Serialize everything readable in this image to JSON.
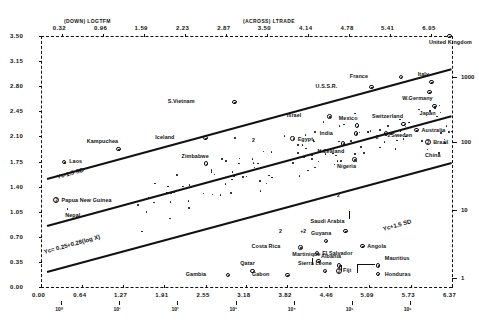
{
  "chart_data": {
    "type": "scatter",
    "title": "",
    "xlabel": "(ACROSS) LTRADE",
    "ylabel": "(DOWN) LOGTFM",
    "xlim": [
      0.0,
      6.37
    ],
    "ylim": [
      0.0,
      3.5
    ],
    "grid": false,
    "legend": "none",
    "x_ticks": [
      "0.00",
      "0.64",
      "1.27",
      "1.91",
      "2.55",
      "3.18",
      "3.82",
      "4.46",
      "5.09",
      "5.73",
      "6.37"
    ],
    "y_ticks": [
      "3.50",
      "3.15",
      "2.80",
      "2.45",
      "2.10",
      "1.75",
      "1.40",
      "1.05",
      "0.70",
      "0.35",
      "0.00"
    ],
    "top_ticks": [
      "0.32",
      "0.96",
      "1.59",
      "2.23",
      "2.87",
      "3.50",
      "4.14",
      "4.78",
      "5.41",
      "6.05"
    ],
    "right_axis_labels": [
      "1000",
      "100",
      "10",
      "1"
    ],
    "x_power_labels": [
      "10⁰",
      "10¹",
      "10²",
      "10³",
      "10⁴",
      "10⁵",
      "10⁶"
    ],
    "annotations": [
      {
        "text": "Yc= 0.25+0.28(log X)",
        "role": "fitted-regression-line"
      },
      {
        "text": "Yc-1.5 SD",
        "role": "lower-confidence-band"
      },
      {
        "text": "Yc+1.5 SD",
        "role": "upper-confidence-band"
      }
    ],
    "labeled_points": [
      {
        "label": "United Kingdom",
        "x": 6.33,
        "y": 3.5,
        "marker": "circle"
      },
      {
        "label": "France",
        "x": 5.58,
        "y": 2.93,
        "marker": "circle"
      },
      {
        "label": "Italy",
        "x": 6.05,
        "y": 2.86,
        "marker": "circle"
      },
      {
        "label": "U.S.S.R.",
        "x": 5.12,
        "y": 2.79,
        "marker": "circle"
      },
      {
        "label": "W.Germany",
        "x": 6.02,
        "y": 2.72,
        "marker": "circle"
      },
      {
        "label": "Japan",
        "x": 6.1,
        "y": 2.52,
        "marker": "circle"
      },
      {
        "label": "S.Vietnam",
        "x": 3.0,
        "y": 2.58,
        "marker": "circle"
      },
      {
        "label": "Israel",
        "x": 4.47,
        "y": 2.38,
        "marker": "circle"
      },
      {
        "label": "Mexico",
        "x": 4.9,
        "y": 2.25,
        "marker": "circle"
      },
      {
        "label": "Switzerland",
        "x": 5.62,
        "y": 2.27,
        "marker": "circle"
      },
      {
        "label": "Australia",
        "x": 5.82,
        "y": 2.19,
        "marker": "circle"
      },
      {
        "label": "India",
        "x": 4.88,
        "y": 2.14,
        "marker": "circle"
      },
      {
        "label": "Sweden",
        "x": 5.35,
        "y": 2.14,
        "marker": "circle"
      },
      {
        "label": "Iceland",
        "x": 2.55,
        "y": 2.08,
        "marker": "circle"
      },
      {
        "label": "Egypt",
        "x": 3.9,
        "y": 2.07,
        "marker": "circle"
      },
      {
        "label": "N.Zealand",
        "x": 4.68,
        "y": 2.0,
        "marker": "circle"
      },
      {
        "label": "Brazil",
        "x": 6.0,
        "y": 2.02,
        "marker": "circle-2"
      },
      {
        "label": "China",
        "x": 5.98,
        "y": 1.93,
        "marker": "dot"
      },
      {
        "label": "Kampuchea",
        "x": 1.2,
        "y": 1.92,
        "marker": "circle"
      },
      {
        "label": "Nigeria",
        "x": 4.86,
        "y": 1.78,
        "marker": "circle"
      },
      {
        "label": "Laos",
        "x": 0.36,
        "y": 1.74,
        "marker": "circle"
      },
      {
        "label": "Zimbabwe",
        "x": 2.56,
        "y": 1.72,
        "marker": "circle"
      },
      {
        "label": "Papua New Guinea",
        "x": 0.24,
        "y": 1.22,
        "marker": "circle-2"
      },
      {
        "label": "Nepal",
        "x": 0.4,
        "y": 1.1,
        "marker": "dot"
      },
      {
        "label": "Saudi Arabia",
        "x": 4.72,
        "y": 0.78,
        "marker": "circle"
      },
      {
        "label": "Guyana",
        "x": 4.42,
        "y": 0.64,
        "marker": "circle"
      },
      {
        "label": "Angola",
        "x": 4.98,
        "y": 0.57,
        "marker": "circle"
      },
      {
        "label": "Costa Rica",
        "x": 4.02,
        "y": 0.55,
        "marker": "circle"
      },
      {
        "label": "El Salvador",
        "x": 4.28,
        "y": 0.47,
        "marker": "circle"
      },
      {
        "label": "Martinique",
        "x": 4.3,
        "y": 0.36,
        "marker": "circle"
      },
      {
        "label": "Albania",
        "x": 4.62,
        "y": 0.3,
        "marker": "circle"
      },
      {
        "label": "Qatar",
        "x": 3.28,
        "y": 0.22,
        "marker": "circle"
      },
      {
        "label": "Sierra Leone",
        "x": 4.4,
        "y": 0.22,
        "marker": "circle"
      },
      {
        "label": "Fiji",
        "x": 4.62,
        "y": 0.22,
        "marker": "circle-2"
      },
      {
        "label": "Gambia",
        "x": 2.9,
        "y": 0.17,
        "marker": "circle"
      },
      {
        "label": "Gabon",
        "x": 3.82,
        "y": 0.17,
        "marker": "circle"
      },
      {
        "label": "Mauritius",
        "x": 5.22,
        "y": 0.3,
        "marker": "circle"
      },
      {
        "label": "Honduras",
        "x": 5.22,
        "y": 0.18,
        "marker": "circle"
      }
    ],
    "unlabeled_point_count": 118,
    "overlap_markers": [
      {
        "text": "2",
        "x": 3.3,
        "y": 2.03
      },
      {
        "text": "2",
        "x": 5.22,
        "y": 2.08
      },
      {
        "text": "2",
        "x": 4.62,
        "y": 1.27
      },
      {
        "text": "2",
        "x": 3.72,
        "y": 0.76
      },
      {
        "text": "+2",
        "x": 4.05,
        "y": 0.76
      },
      {
        "text": "2",
        "x": 5.4,
        "y": 2.1
      }
    ]
  },
  "axes": {
    "top_header_down": "(DOWN) LOGTFM",
    "top_header_across": "(ACROSS) LTRADE"
  },
  "icons": {
    "circle_marker": "circled-dot-marker",
    "overlap_marker": "overlap-count-marker"
  }
}
